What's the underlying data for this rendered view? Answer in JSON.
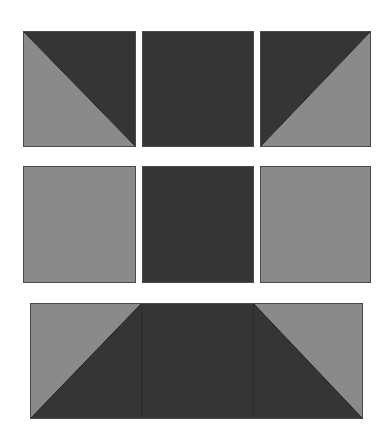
{
  "diagram": {
    "colors": {
      "dark": "#353535",
      "light": "#8a8a8a",
      "edge": "#4a4a4a",
      "background": "#ffffff"
    },
    "rows": [
      {
        "name": "top-row",
        "blocks": [
          {
            "name": "half-square-triangle-dark-upper-right",
            "pattern": "hst",
            "dark": "upper-right",
            "light": "lower-left"
          },
          {
            "name": "solid-dark-square",
            "pattern": "solid",
            "fill": "dark"
          },
          {
            "name": "half-square-triangle-dark-upper-left",
            "pattern": "hst",
            "dark": "upper-left",
            "light": "lower-right"
          }
        ]
      },
      {
        "name": "middle-row",
        "blocks": [
          {
            "name": "solid-light-square-left",
            "pattern": "solid",
            "fill": "light"
          },
          {
            "name": "solid-dark-square-center",
            "pattern": "solid",
            "fill": "dark"
          },
          {
            "name": "solid-light-square-right",
            "pattern": "solid",
            "fill": "light"
          }
        ]
      },
      {
        "name": "bottom-row",
        "blocks": [
          {
            "name": "flying-geese-strip",
            "pattern": "trapezoid",
            "dark": "center-trapezoid",
            "light": "upper-corners",
            "segments": 3
          }
        ]
      }
    ]
  }
}
